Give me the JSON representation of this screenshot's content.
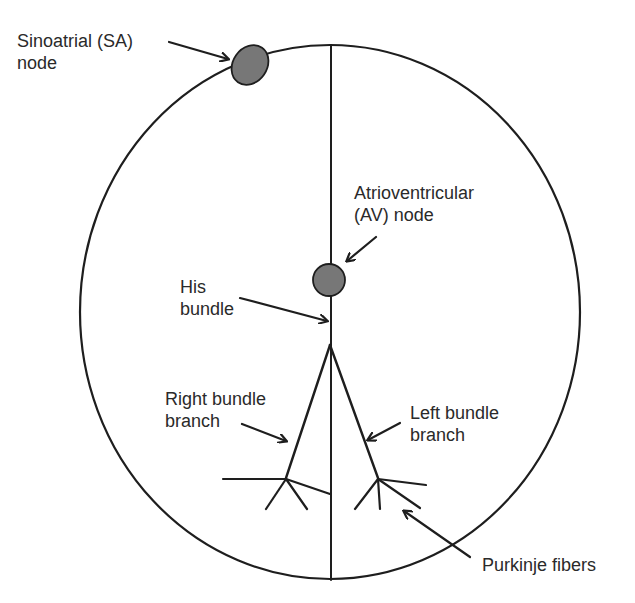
{
  "diagram": {
    "colors": {
      "line": "#1e1e1e",
      "node_fill": "#777777",
      "text": "#2a2a2a",
      "background": "#ffffff"
    },
    "labels": {
      "sa_node": {
        "line1": "Sinoatrial (SA)",
        "line2": "node"
      },
      "av_node": {
        "line1": "Atrioventricular",
        "line2": "(AV) node"
      },
      "his_bundle": {
        "line1": "His",
        "line2": "bundle"
      },
      "right_bundle_branch": {
        "line1": "Right bundle",
        "line2": "branch"
      },
      "left_bundle_branch": {
        "line1": "Left bundle",
        "line2": "branch"
      },
      "purkinje_fibers": {
        "line1": "Purkinje fibers"
      }
    }
  }
}
